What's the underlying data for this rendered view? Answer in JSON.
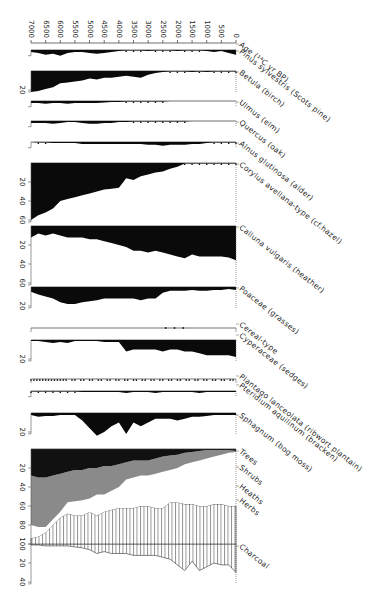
{
  "chart_data": {
    "type": "area",
    "orientation": "age axis horizontal at top, taxa panels stacked vertically, percentages increase downward",
    "age_axis": {
      "label": "Age (14C yr BP)",
      "ticks": [
        7000,
        6500,
        6000,
        5500,
        5000,
        4500,
        4000,
        3500,
        3000,
        2500,
        2000,
        1500,
        1000,
        500,
        0
      ],
      "range": [
        7000,
        0
      ]
    },
    "x_ages": [
      7000,
      6750,
      6500,
      6250,
      6000,
      5750,
      5500,
      5250,
      5000,
      4750,
      4500,
      4250,
      4000,
      3750,
      3500,
      3250,
      3000,
      2750,
      2500,
      2250,
      2000,
      1750,
      1500,
      1250,
      1000,
      750,
      500,
      250,
      0
    ],
    "series": [
      {
        "name": "Pinus sylvestris (Scots pine)",
        "baseline_y": 50,
        "scale_ticks": [],
        "fill": "black",
        "values": [
          2,
          3,
          5,
          4,
          6,
          3,
          2,
          2,
          3,
          4,
          3,
          2,
          1,
          0.5,
          0.5,
          0.5,
          1,
          0.5,
          0.5,
          0.5,
          1,
          0.5,
          0.5,
          0.5,
          1,
          2,
          1,
          3,
          5
        ]
      },
      {
        "name": "Betula (birch)",
        "baseline_y": 71,
        "scale_ticks": [
          20
        ],
        "fill": "black",
        "values": [
          22,
          21,
          19,
          17,
          13,
          12,
          11,
          10,
          8,
          9,
          7,
          7,
          6,
          5,
          6,
          7,
          4,
          2,
          1,
          0.5,
          0.5,
          0.5,
          1,
          0.5,
          1,
          0.5,
          0.5,
          0.5,
          0.5
        ]
      },
      {
        "name": "Ulmus (elm)",
        "baseline_y": 101,
        "scale_ticks": [],
        "fill": "black",
        "values": [
          2,
          2,
          3,
          2,
          2,
          3,
          2,
          2,
          2,
          2,
          1.5,
          1,
          1,
          0.5,
          0.5,
          0.5,
          0.5,
          0.5,
          0.5,
          0,
          0,
          0,
          0,
          0,
          0,
          0,
          0,
          0,
          0
        ]
      },
      {
        "name": "Quercus (oak)",
        "baseline_y": 121,
        "scale_ticks": [],
        "fill": "black",
        "values": [
          2,
          2,
          2,
          3,
          2,
          1,
          1,
          2,
          3,
          3,
          2,
          2,
          1,
          1,
          0.5,
          0.5,
          0.5,
          0.5,
          0.5,
          0.5,
          0.5,
          0.5,
          0,
          0,
          0,
          0,
          0,
          0,
          0
        ]
      },
      {
        "name": "Alnus glutinosa (alder)",
        "baseline_y": 142,
        "scale_ticks": [],
        "fill": "black",
        "values": [
          0,
          0.5,
          0.5,
          1,
          1,
          1,
          1,
          2,
          2,
          2,
          2,
          2,
          2,
          2,
          2,
          2,
          3,
          3,
          4,
          3,
          3,
          3,
          2,
          2,
          1,
          0.5,
          0.5,
          0.5,
          0.5
        ]
      },
      {
        "name": "Corylus avellana-type (cf.hazel)",
        "baseline_y": 163,
        "scale_ticks": [
          20,
          40,
          60
        ],
        "fill": "black",
        "values": [
          60,
          55,
          52,
          48,
          40,
          38,
          36,
          34,
          32,
          30,
          28,
          27,
          26,
          16,
          18,
          14,
          12,
          10,
          9,
          6,
          4,
          0.5,
          0.5,
          0.5,
          0.5,
          0.5,
          0.5,
          0.5,
          0.5
        ]
      },
      {
        "name": "Calluna vulgaris (heather)",
        "baseline_y": 226,
        "scale_ticks": [
          20,
          40,
          60
        ],
        "fill": "black",
        "values": [
          12,
          8,
          10,
          8,
          10,
          12,
          12,
          12,
          14,
          14,
          16,
          18,
          20,
          22,
          26,
          26,
          28,
          26,
          28,
          30,
          32,
          34,
          30,
          32,
          32,
          32,
          32,
          33,
          36
        ]
      },
      {
        "name": "Poaceae (grasses)",
        "baseline_y": 287,
        "scale_ticks": [
          20
        ],
        "fill": "black",
        "values": [
          5,
          8,
          10,
          12,
          16,
          18,
          18,
          16,
          15,
          14,
          12,
          12,
          12,
          12,
          12,
          14,
          12,
          12,
          6,
          4,
          4,
          4,
          3,
          4,
          4,
          3,
          3,
          2,
          3
        ]
      },
      {
        "name": "Cereal-type",
        "baseline_y": 328,
        "scale_ticks": [],
        "fill": "dots",
        "present_ages": [
          2400,
          2100,
          1800
        ]
      },
      {
        "name": "Cyperaceae (sedges)",
        "baseline_y": 340,
        "scale_ticks": [
          20
        ],
        "fill": "black",
        "values": [
          1,
          1,
          2,
          3,
          2,
          3,
          1,
          1,
          1,
          1,
          2,
          2,
          2,
          12,
          10,
          10,
          10,
          10,
          12,
          10,
          10,
          12,
          12,
          14,
          16,
          16,
          16,
          16,
          18
        ]
      },
      {
        "name": "Plantago lanceolata (ribwort plantain)",
        "baseline_y": 379,
        "scale_ticks": [],
        "fill": "dots",
        "present_range": [
          7000,
          0
        ]
      },
      {
        "name": "Pteridium aquilinum (bracken)",
        "baseline_y": 391,
        "scale_ticks": [],
        "fill": "black",
        "values": [
          0.5,
          0.5,
          0.5,
          0.5,
          0.5,
          0.5,
          0.5,
          1,
          1,
          1,
          1,
          1,
          1,
          2,
          1,
          1,
          1,
          2,
          1,
          1,
          1,
          1,
          1,
          2,
          1,
          1,
          1,
          1,
          1
        ]
      },
      {
        "name": "Sphagnum (bog moss)",
        "baseline_y": 413,
        "scale_ticks": [
          20
        ],
        "fill": "black",
        "values": [
          2,
          4,
          3,
          3,
          2,
          2,
          2,
          8,
          16,
          24,
          20,
          14,
          10,
          22,
          10,
          14,
          10,
          6,
          6,
          6,
          8,
          6,
          4,
          4,
          3,
          2,
          2,
          2,
          2
        ]
      },
      {
        "name": "Charcoal",
        "baseline_y": 544,
        "scale_ticks": [
          20,
          40
        ],
        "fill": "hatched",
        "values": [
          1,
          1,
          2,
          2,
          2,
          2,
          3,
          4,
          6,
          10,
          8,
          10,
          10,
          10,
          12,
          12,
          12,
          12,
          14,
          16,
          22,
          28,
          18,
          28,
          24,
          20,
          22,
          22,
          30
        ]
      }
    ],
    "composite": {
      "baseline_y": 449,
      "scale_ticks": [
        20,
        40,
        60,
        80,
        100
      ],
      "groups": [
        "Trees",
        "Shrubs",
        "Heaths",
        "Herbs"
      ],
      "fills": {
        "Trees": "#111111",
        "Shrubs": "#8a8a8a",
        "Heaths": "#ffffff",
        "Herbs": "hatched"
      },
      "trees_cum": [
        28,
        30,
        30,
        28,
        26,
        24,
        22,
        22,
        20,
        20,
        18,
        18,
        16,
        14,
        12,
        12,
        12,
        10,
        8,
        7,
        6,
        4,
        3,
        2,
        1,
        1,
        1,
        1,
        2
      ],
      "shrubs_cum": [
        80,
        82,
        82,
        74,
        66,
        56,
        55,
        54,
        52,
        48,
        48,
        44,
        40,
        32,
        30,
        28,
        28,
        26,
        24,
        22,
        20,
        16,
        14,
        12,
        10,
        8,
        6,
        4,
        3
      ],
      "heaths_cum": [
        94,
        92,
        88,
        80,
        72,
        68,
        70,
        70,
        66,
        70,
        66,
        64,
        62,
        62,
        62,
        60,
        60,
        62,
        62,
        56,
        56,
        58,
        58,
        60,
        60,
        58,
        58,
        60,
        60
      ]
    }
  },
  "labels": {
    "age_axis": "Age (¹⁴C yr BP)",
    "taxa": [
      "Pinus sylvestris (Scots pine)",
      "Betula (birch)",
      "Ulmus (elm)",
      "Quercus (oak)",
      "Alnus glutinosa (alder)",
      "Corylus avellana-type (cf.hazel)",
      "Calluna vulgaris (heather)",
      "Poaceae (grasses)",
      "Cereal-type",
      "Cyperaceae (sedges)",
      "Plantago lanceolata (ribwort plantain)",
      "Pteridium aquilinum (bracken)",
      "Sphagnum (bog moss)",
      "Trees",
      "Shrubs",
      "Heaths",
      "Herbs",
      "Charcoal"
    ]
  }
}
